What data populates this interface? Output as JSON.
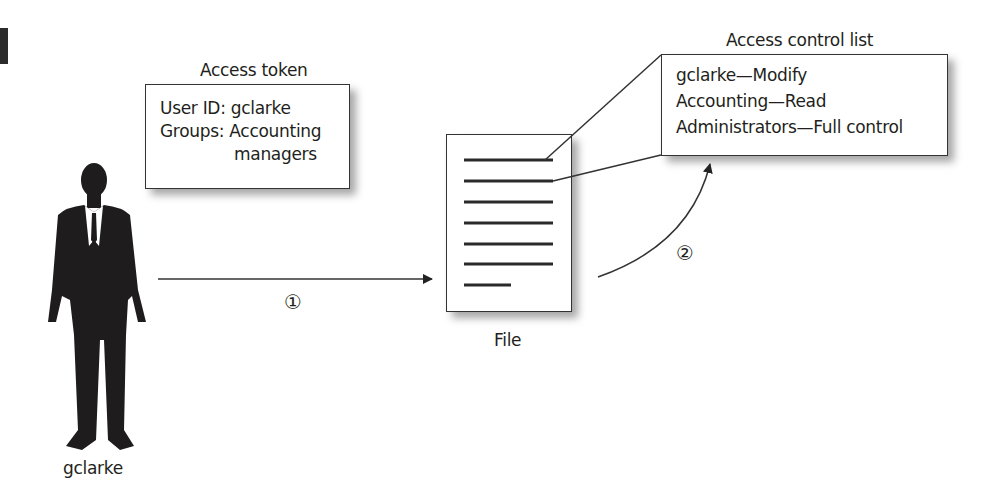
{
  "diagram": {
    "access_token": {
      "title": "Access token",
      "lines": [
        "User ID: gclarke",
        "Groups: Accounting",
        "managers"
      ]
    },
    "acl": {
      "title": "Access control list",
      "entries": [
        "gclarke—Modify",
        "Accounting—Read",
        "Administrators—Full control"
      ]
    },
    "file": {
      "label": "File",
      "line_count": 7
    },
    "user": {
      "label": "gclarke",
      "icon": "person-silhouette-icon"
    },
    "steps": [
      {
        "label": "①",
        "description": "User accesses file"
      },
      {
        "label": "②",
        "description": "File checked against access control list"
      }
    ],
    "colors": {
      "stroke": "#333333",
      "text": "#231f20",
      "silhouette": "#1e1c1c"
    }
  }
}
